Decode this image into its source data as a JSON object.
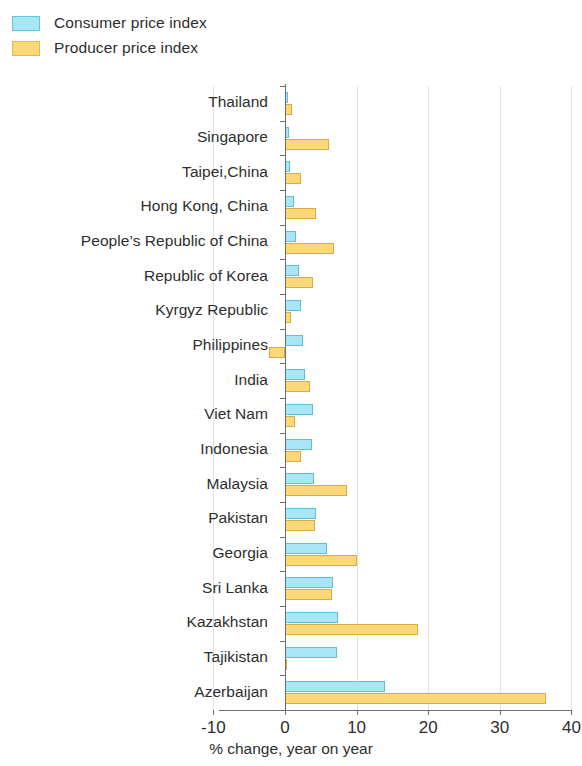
{
  "legend": {
    "position": "top-left",
    "items": [
      {
        "label": "Consumer price index",
        "color": "#a8e6f5",
        "border": "#4db7d8",
        "series_key": "cpi"
      },
      {
        "label": "Producer price index",
        "color": "#fbd97a",
        "border": "#e5a93c",
        "series_key": "ppi"
      }
    ]
  },
  "axis": {
    "x_title": "% change, year on year",
    "x_ticks": [
      "-10",
      "0",
      "10",
      "20",
      "30",
      "40"
    ]
  },
  "chart_data": {
    "type": "bar",
    "orientation": "horizontal",
    "title": "",
    "subtitle": "",
    "xlabel": "% change, year on year",
    "ylabel": "",
    "xlim": [
      -10,
      40
    ],
    "xticks": [
      -10,
      0,
      10,
      20,
      30,
      40
    ],
    "grid": true,
    "legend_position": "top-left",
    "categories": [
      "Thailand",
      "Singapore",
      "Taipei,China",
      "Hong Kong, China",
      "People’s Republic of China",
      "Republic of Korea",
      "Kyrgyz Republic",
      "Philippines",
      "India",
      "Viet Nam",
      "Indonesia",
      "Malaysia",
      "Pakistan",
      "Georgia",
      "Sri Lanka",
      "Kazakhstan",
      "Tajikistan",
      "Azerbaijan"
    ],
    "series": [
      {
        "name": "Consumer price index",
        "key": "cpi",
        "color": "#a8e6f5",
        "values": [
          0.4,
          0.6,
          0.7,
          1.3,
          1.5,
          1.9,
          2.3,
          2.5,
          2.8,
          3.9,
          3.8,
          4.1,
          4.3,
          5.8,
          6.7,
          7.4,
          7.2,
          13.9
        ]
      },
      {
        "name": "Producer price index",
        "key": "ppi",
        "color": "#fbd97a",
        "values": [
          1.0,
          6.1,
          2.2,
          4.3,
          6.8,
          3.9,
          0.8,
          -2.2,
          3.5,
          1.4,
          2.3,
          8.7,
          4.2,
          10.1,
          6.6,
          18.6,
          0.2,
          36.5
        ]
      }
    ]
  }
}
